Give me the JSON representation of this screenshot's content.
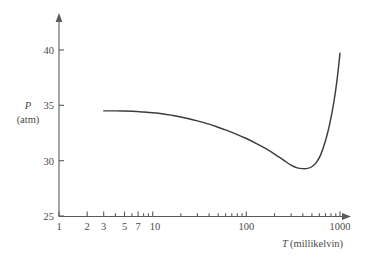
{
  "chart_data": {
    "type": "line",
    "title": "",
    "xlabel": "T (millikelvin)",
    "xlabel_symbol": "T",
    "xlabel_unit": "(millikelvin)",
    "ylabel": "P (atm)",
    "ylabel_symbol": "P",
    "ylabel_unit": "(atm)",
    "xscale": "log",
    "yscale": "linear",
    "xlim": [
      1,
      1000
    ],
    "ylim": [
      25,
      40
    ],
    "grid": false,
    "legend": null,
    "x_tick_labels": [
      "1",
      "2",
      "3",
      "5",
      "7",
      "10",
      "100",
      "1000"
    ],
    "x_tick_values": [
      1,
      2,
      3,
      5,
      7,
      10,
      100,
      1000
    ],
    "x_minor_ticks": [
      4,
      6,
      8,
      9,
      20,
      30,
      40,
      50,
      60,
      70,
      80,
      90,
      200,
      300,
      400,
      500,
      600,
      700,
      800,
      900
    ],
    "y_tick_labels": [
      "25",
      "30",
      "35",
      "40"
    ],
    "y_tick_values": [
      25,
      30,
      35,
      40
    ],
    "series": [
      {
        "name": "melting curve",
        "color": "#3c3c3c",
        "x": [
          3,
          4,
          5,
          6,
          7,
          8,
          10,
          13,
          16,
          20,
          25,
          30,
          40,
          50,
          60,
          80,
          100,
          130,
          160,
          200,
          250,
          300,
          350,
          400,
          450,
          500,
          560,
          620,
          700,
          780,
          860,
          930,
          1000
        ],
        "y": [
          34.5,
          34.5,
          34.48,
          34.46,
          34.43,
          34.4,
          34.33,
          34.22,
          34.1,
          33.95,
          33.77,
          33.6,
          33.3,
          33.02,
          32.78,
          32.36,
          32.0,
          31.52,
          31.1,
          30.6,
          30.05,
          29.6,
          29.35,
          29.28,
          29.3,
          29.45,
          29.85,
          30.5,
          31.8,
          33.4,
          35.3,
          37.3,
          39.7
        ]
      }
    ],
    "annotations": {
      "minimum_point": {
        "x": 400,
        "y": 29.28
      },
      "start_point": {
        "x": 3,
        "y": 34.5
      },
      "end_point": {
        "x": 1000,
        "y": 39.7
      }
    }
  },
  "axes": {
    "y_arrow": "up-arrow",
    "x_arrow": "right-arrow"
  }
}
